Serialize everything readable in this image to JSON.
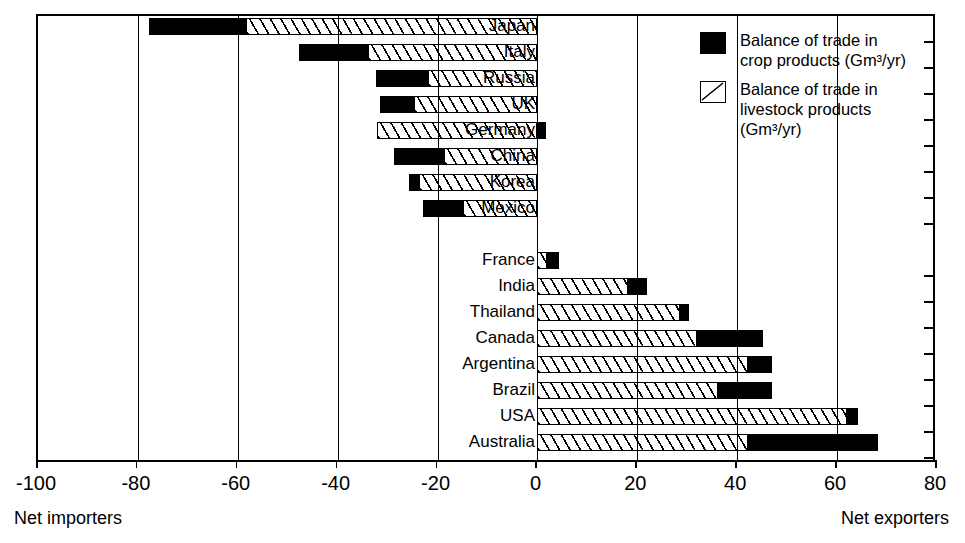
{
  "chart_data": {
    "type": "bar",
    "orientation": "horizontal",
    "title": "",
    "xlabel": "",
    "ylabel": "",
    "xlim": [
      -100,
      80
    ],
    "xticks": [
      -100,
      -80,
      -60,
      -40,
      -20,
      0,
      20,
      40,
      60,
      80
    ],
    "xticklabels": [
      "-100",
      "-80",
      "-60",
      "-40",
      "-20",
      "0",
      "20",
      "40",
      "60",
      "80"
    ],
    "grid": true,
    "units": "Gm³/yr",
    "legend_position": "top-right",
    "series": [
      {
        "name": "Balance of trade in crop products (Gm³/yr)",
        "key": "crop",
        "pattern": "solid-black",
        "values": [
          -19.4,
          -13.8,
          -10.4,
          -6.8,
          1.7,
          -10.0,
          -2.0,
          -8.0,
          null,
          2.4,
          3.8,
          1.8,
          13.2,
          4.8,
          10.8,
          2.2,
          26.0
        ]
      },
      {
        "name": "Balance of trade in livestock products (Gm³/yr)",
        "key": "livestock",
        "pattern": "diagonal-hatch",
        "values": [
          -58.4,
          -34.0,
          -22.0,
          -24.8,
          -32.2,
          -18.8,
          -23.8,
          -15.0,
          null,
          2.0,
          18.2,
          28.6,
          32.0,
          42.2,
          36.2,
          62.0,
          42.2
        ]
      }
    ],
    "categories": [
      "Japan",
      "Italy",
      "Russia",
      "UK",
      "Germany",
      "China",
      "Korea",
      "Mexico",
      "",
      "France",
      "India",
      "Thailand",
      "Canada",
      "Argentina",
      "Brazil",
      "USA",
      "Australia"
    ],
    "bars": [
      {
        "label": "Japan",
        "crop_start": -77.8,
        "crop_end": -58.4,
        "live_start": -58.4,
        "live_end": 0,
        "total": -77.8
      },
      {
        "label": "Italy",
        "crop_start": -47.8,
        "crop_end": -34.0,
        "live_start": -34.0,
        "live_end": 0,
        "total": -47.8
      },
      {
        "label": "Russia",
        "crop_start": -32.4,
        "crop_end": -22.0,
        "live_start": -22.0,
        "live_end": 0,
        "total": -32.4
      },
      {
        "label": "UK",
        "crop_start": -31.6,
        "crop_end": -24.8,
        "live_start": -24.8,
        "live_end": 0,
        "total": -31.6
      },
      {
        "label": "Germany",
        "crop_start": 0,
        "crop_end": 1.7,
        "live_start": -32.2,
        "live_end": 0,
        "total": -30.5
      },
      {
        "label": "China",
        "crop_start": -28.8,
        "crop_end": -18.8,
        "live_start": -18.8,
        "live_end": 0,
        "total": -28.8
      },
      {
        "label": "Korea",
        "crop_start": -25.8,
        "crop_end": -23.8,
        "live_start": -23.8,
        "live_end": 0,
        "total": -25.8
      },
      {
        "label": "Mexico",
        "crop_start": -23.0,
        "crop_end": -15.0,
        "live_start": -15.0,
        "live_end": 0,
        "total": -23.0
      },
      {
        "label": "",
        "crop_start": null,
        "crop_end": null,
        "live_start": null,
        "live_end": null,
        "total": null
      },
      {
        "label": "France",
        "crop_start": 2.0,
        "crop_end": 4.4,
        "live_start": 0,
        "live_end": 2.0,
        "total": 4.4
      },
      {
        "label": "India",
        "crop_start": 18.2,
        "crop_end": 22.0,
        "live_start": 0,
        "live_end": 18.2,
        "total": 22.0
      },
      {
        "label": "Thailand",
        "crop_start": 28.6,
        "crop_end": 30.4,
        "live_start": 0,
        "live_end": 28.6,
        "total": 30.4
      },
      {
        "label": "Canada",
        "crop_start": 32.0,
        "crop_end": 45.2,
        "live_start": 0,
        "live_end": 32.0,
        "total": 45.2
      },
      {
        "label": "Argentina",
        "crop_start": 42.2,
        "crop_end": 47.0,
        "live_start": 0,
        "live_end": 42.2,
        "total": 47.0
      },
      {
        "label": "Brazil",
        "crop_start": 36.2,
        "crop_end": 47.0,
        "live_start": 0,
        "live_end": 36.2,
        "total": 47.0
      },
      {
        "label": "USA",
        "crop_start": 62.0,
        "crop_end": 64.2,
        "live_start": 0,
        "live_end": 62.0,
        "total": 64.2
      },
      {
        "label": "Australia",
        "crop_start": 42.2,
        "crop_end": 68.2,
        "live_start": 0,
        "live_end": 42.2,
        "total": 68.2
      }
    ],
    "annotations": [
      {
        "text": "Net importers",
        "position": "bottom-left"
      },
      {
        "text": "Net exporters",
        "position": "bottom-right"
      }
    ]
  },
  "legend": {
    "items": [
      {
        "swatch": "solid-black",
        "line1": "Balance of trade in",
        "line2": "crop products (Gm³/yr)"
      },
      {
        "swatch": "diagonal-hatch",
        "line1": "Balance of trade in",
        "line2": "livestock products",
        "line3": "(Gm³/yr)"
      }
    ]
  },
  "footer": {
    "left": "Net importers",
    "right": "Net exporters"
  }
}
